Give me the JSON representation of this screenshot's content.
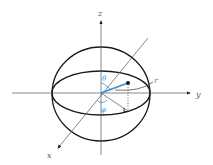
{
  "diagram": {
    "type": "spherical-coordinates",
    "axes": {
      "z_label": "z",
      "y_label": "y",
      "x_label": "x"
    },
    "labels": {
      "radius": "r",
      "polar_angle": "θ",
      "azimuth_angle": "φ"
    },
    "colors": {
      "line": "#1a1a1a",
      "accent": "#3a8fd6",
      "axis_label": "#555555"
    }
  }
}
